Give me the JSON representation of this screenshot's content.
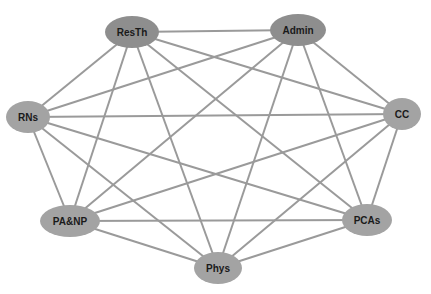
{
  "diagram": {
    "type": "complete-graph",
    "edge_color": "#9a9a9a",
    "nodes": [
      {
        "id": "ResTh",
        "label": "ResTh",
        "cx": 132,
        "cy": 32,
        "rx": 27,
        "ry": 16,
        "color": "#8e8e8e"
      },
      {
        "id": "Admin",
        "label": "Admin",
        "cx": 298,
        "cy": 30,
        "rx": 28,
        "ry": 16,
        "color": "#8e8e8e"
      },
      {
        "id": "RNs",
        "label": "RNs",
        "cx": 28,
        "cy": 117,
        "rx": 22,
        "ry": 16,
        "color": "#a3a3a3"
      },
      {
        "id": "CC",
        "label": "CC",
        "cx": 402,
        "cy": 114,
        "rx": 19,
        "ry": 16,
        "color": "#a3a3a3"
      },
      {
        "id": "PA&NP",
        "label": "PA&NP",
        "cx": 70,
        "cy": 221,
        "rx": 30,
        "ry": 16,
        "color": "#a3a3a3"
      },
      {
        "id": "PCAs",
        "label": "PCAs",
        "cx": 367,
        "cy": 220,
        "rx": 25,
        "ry": 16,
        "color": "#a3a3a3"
      },
      {
        "id": "Phys",
        "label": "Phys",
        "cx": 218,
        "cy": 268,
        "rx": 24,
        "ry": 16,
        "color": "#a3a3a3"
      }
    ],
    "edges": [
      [
        "ResTh",
        "Admin"
      ],
      [
        "ResTh",
        "RNs"
      ],
      [
        "ResTh",
        "CC"
      ],
      [
        "ResTh",
        "PA&NP"
      ],
      [
        "ResTh",
        "PCAs"
      ],
      [
        "ResTh",
        "Phys"
      ],
      [
        "Admin",
        "RNs"
      ],
      [
        "Admin",
        "CC"
      ],
      [
        "Admin",
        "PA&NP"
      ],
      [
        "Admin",
        "PCAs"
      ],
      [
        "Admin",
        "Phys"
      ],
      [
        "RNs",
        "CC"
      ],
      [
        "RNs",
        "PA&NP"
      ],
      [
        "RNs",
        "PCAs"
      ],
      [
        "RNs",
        "Phys"
      ],
      [
        "CC",
        "PA&NP"
      ],
      [
        "CC",
        "PCAs"
      ],
      [
        "CC",
        "Phys"
      ],
      [
        "PA&NP",
        "PCAs"
      ],
      [
        "PA&NP",
        "Phys"
      ],
      [
        "PCAs",
        "Phys"
      ]
    ]
  }
}
